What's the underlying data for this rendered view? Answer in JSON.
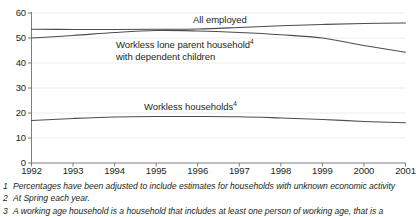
{
  "chart_data": {
    "type": "line",
    "title": "",
    "xlabel": "",
    "ylabel": "",
    "xlim": [
      1992,
      2001
    ],
    "ylim": [
      0,
      60
    ],
    "grid": true,
    "legend_position": "inline-annotations",
    "x": [
      1992,
      1993,
      1994,
      1995,
      1996,
      1997,
      1998,
      1999,
      2000,
      2001
    ],
    "xtick_labels": [
      "1992",
      "1993",
      "1994",
      "1995",
      "1996",
      "1997",
      "1998",
      "1999",
      "2000",
      "2001"
    ],
    "ytick_labels": [
      "0",
      "10",
      "20",
      "30",
      "40",
      "50",
      "60"
    ],
    "ytick_values": [
      0,
      10,
      20,
      30,
      40,
      50,
      60
    ],
    "series": [
      {
        "name": "All employed",
        "label_main": "All employed",
        "label_sup": "",
        "label_line2": "",
        "color": "#4d4d4d",
        "values": [
          53.5,
          53.4,
          53.4,
          53.5,
          53.6,
          54.2,
          54.9,
          55.4,
          55.8,
          56.0
        ]
      },
      {
        "name": "Workless lone parent household with dependent children",
        "label_main": "Workless lone parent household",
        "label_sup": "4",
        "label_line2": "with dependent children",
        "color": "#4d4d4d",
        "values": [
          50.0,
          51.0,
          52.2,
          53.0,
          52.8,
          52.2,
          51.3,
          50.0,
          47.0,
          44.3
        ]
      },
      {
        "name": "Workless households",
        "label_main": "Workless households",
        "label_sup": "4",
        "label_line2": "",
        "color": "#4d4d4d",
        "values": [
          17.0,
          17.8,
          18.4,
          18.6,
          18.6,
          18.5,
          18.0,
          17.4,
          16.6,
          16.1
        ]
      }
    ]
  },
  "annotations": {
    "all_employed": {
      "text": "All employed"
    },
    "lone_parent": {
      "line1": "Workless lone parent household",
      "sup": "4",
      "line2": "with dependent children"
    },
    "workless_households": {
      "text": "Workless households",
      "sup": "4"
    }
  },
  "footnotes": [
    {
      "num": "1",
      "text": "Percentages have been adjusted to include estimates for households with unknown economic activity"
    },
    {
      "num": "2",
      "text": "At Spring each year."
    },
    {
      "num": "3",
      "text": "A working age household is a household that includes at least one person of working age, that is a"
    }
  ]
}
